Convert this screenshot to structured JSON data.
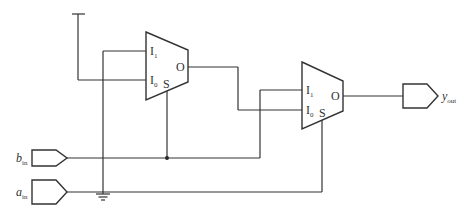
{
  "diagram": {
    "type": "circuit-schematic",
    "inputs": [
      {
        "id": "b_in",
        "label": "b",
        "subscript": "in"
      },
      {
        "id": "a_in",
        "label": "a",
        "subscript": "in"
      }
    ],
    "outputs": [
      {
        "id": "y_out",
        "label": "y",
        "subscript": "out"
      }
    ],
    "mux1": {
      "pins": {
        "i1": "I",
        "i1_sub": "1",
        "i0": "I",
        "i0_sub": "0",
        "out": "O",
        "sel": "S"
      },
      "connections": {
        "I1": "ground",
        "I0": "logic-high (supply)",
        "S": "b_in"
      }
    },
    "mux2": {
      "pins": {
        "i1": "I",
        "i1_sub": "1",
        "i0": "I",
        "i0_sub": "0",
        "out": "O",
        "sel": "S"
      },
      "connections": {
        "I1": "b_in",
        "I0": "mux1.O",
        "S": "a_in",
        "O": "y_out"
      }
    },
    "symbols": [
      "supply-tee",
      "ground",
      "junction-dot"
    ],
    "colors": {
      "stroke": "#333333",
      "background": "#ffffff"
    }
  }
}
